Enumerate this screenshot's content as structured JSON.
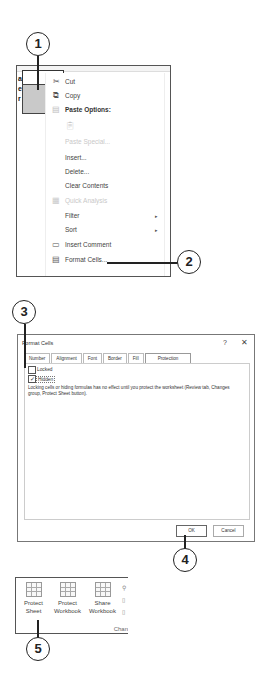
{
  "callouts": [
    "1",
    "2",
    "3",
    "4",
    "5"
  ],
  "context_menu": {
    "row_labels": [
      "a",
      "e",
      "r"
    ],
    "items": [
      {
        "label": "Cut",
        "icon": "scissors-icon",
        "enabled": true
      },
      {
        "label": "Copy",
        "icon": "copy-icon",
        "enabled": true
      },
      {
        "label": "Paste Options:",
        "icon": "paste-icon",
        "enabled": true,
        "header": true
      },
      {
        "label": "",
        "icon": "paste-clipboard-icon",
        "enabled": false
      },
      {
        "label": "Paste Special...",
        "icon": "",
        "enabled": false
      },
      {
        "label": "Insert...",
        "icon": "",
        "enabled": true
      },
      {
        "label": "Delete...",
        "icon": "",
        "enabled": true
      },
      {
        "label": "Clear Contents",
        "icon": "",
        "enabled": true
      },
      {
        "label": "Quick Analysis",
        "icon": "quick-analysis-icon",
        "enabled": false
      },
      {
        "label": "Filter",
        "icon": "",
        "enabled": true,
        "submenu": true
      },
      {
        "label": "Sort",
        "icon": "",
        "enabled": true,
        "submenu": true
      },
      {
        "label": "Insert Comment",
        "icon": "comment-icon",
        "enabled": true
      },
      {
        "label": "Format Cells...",
        "icon": "format-cells-icon",
        "enabled": true
      }
    ],
    "submenu_arrow": "▸"
  },
  "dialog": {
    "title": "Format Cells",
    "help": "?",
    "close": "✕",
    "tabs": [
      "Number",
      "Alignment",
      "Font",
      "Border",
      "Fill",
      "Protection"
    ],
    "active_tab": "Protection",
    "locked_label": "Locked",
    "locked_checked": false,
    "hidden_label": "Hidden",
    "hidden_checked": true,
    "check_mark": "✓",
    "note": "Locking cells or hiding formulas has no effect until you protect the worksheet (Review tab, Changes group, Protect Sheet button).",
    "ok_label": "OK",
    "cancel_label": "Cancel"
  },
  "ribbon": {
    "buttons": [
      {
        "line1": "Protect",
        "line2": "Sheet"
      },
      {
        "line1": "Protect",
        "line2": "Workbook"
      },
      {
        "line1": "Share",
        "line2": "Workbook"
      }
    ],
    "group_label": "Chan"
  }
}
